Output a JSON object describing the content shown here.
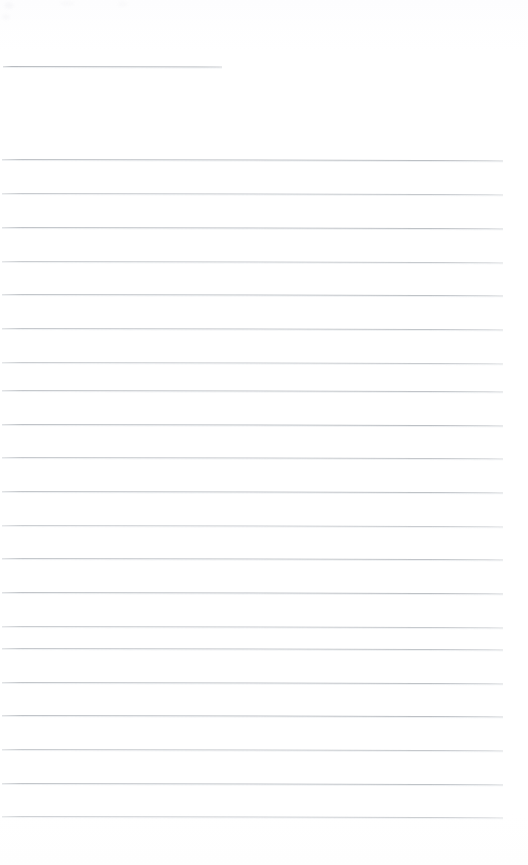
{
  "document": {
    "kind": "scanned-lined-paper",
    "title_line_present": true,
    "page_width": 528,
    "page_height": 865,
    "background_color": "#ffffff",
    "rule_color": "#b9bdc2",
    "rule_thickness_px": 1,
    "text_content": "",
    "visible_text": [],
    "notes": "Blank ruled writing paper, no handwriting or printed text visible."
  },
  "header_rule": {
    "name": "title-rule",
    "x": 3,
    "y": 66,
    "width": 219,
    "tilt_deg": 0.12,
    "opacity": 0.95
  },
  "body_rules": [
    {
      "y": 159,
      "x": 2,
      "width": 501,
      "tilt_deg": 0.14,
      "opacity": 0.95
    },
    {
      "y": 193,
      "x": 2,
      "width": 501,
      "tilt_deg": 0.13,
      "opacity": 0.82
    },
    {
      "y": 227,
      "x": 2,
      "width": 501,
      "tilt_deg": 0.14,
      "opacity": 0.92
    },
    {
      "y": 261,
      "x": 2,
      "width": 501,
      "tilt_deg": 0.13,
      "opacity": 0.8
    },
    {
      "y": 294,
      "x": 2,
      "width": 501,
      "tilt_deg": 0.14,
      "opacity": 0.9
    },
    {
      "y": 328,
      "x": 2,
      "width": 501,
      "tilt_deg": 0.13,
      "opacity": 0.86
    },
    {
      "y": 362,
      "x": 2,
      "width": 501,
      "tilt_deg": 0.14,
      "opacity": 0.78
    },
    {
      "y": 390,
      "x": 2,
      "width": 501,
      "tilt_deg": 0.13,
      "opacity": 0.88
    },
    {
      "y": 424,
      "x": 2,
      "width": 501,
      "tilt_deg": 0.14,
      "opacity": 0.95
    },
    {
      "y": 457,
      "x": 2,
      "width": 501,
      "tilt_deg": 0.13,
      "opacity": 0.84
    },
    {
      "y": 491,
      "x": 2,
      "width": 501,
      "tilt_deg": 0.14,
      "opacity": 0.9
    },
    {
      "y": 525,
      "x": 2,
      "width": 501,
      "tilt_deg": 0.13,
      "opacity": 0.76
    },
    {
      "y": 558,
      "x": 2,
      "width": 501,
      "tilt_deg": 0.14,
      "opacity": 0.88
    },
    {
      "y": 592,
      "x": 2,
      "width": 501,
      "tilt_deg": 0.13,
      "opacity": 0.92
    },
    {
      "y": 626,
      "x": 2,
      "width": 501,
      "tilt_deg": 0.14,
      "opacity": 0.8
    },
    {
      "y": 648,
      "x": 2,
      "width": 501,
      "tilt_deg": 0.13,
      "opacity": 0.86
    },
    {
      "y": 682,
      "x": 2,
      "width": 501,
      "tilt_deg": 0.14,
      "opacity": 0.9
    },
    {
      "y": 715,
      "x": 2,
      "width": 501,
      "tilt_deg": 0.13,
      "opacity": 0.94
    },
    {
      "y": 749,
      "x": 2,
      "width": 501,
      "tilt_deg": 0.14,
      "opacity": 0.82
    },
    {
      "y": 783,
      "x": 2,
      "width": 501,
      "tilt_deg": 0.13,
      "opacity": 0.9
    },
    {
      "y": 816,
      "x": 2,
      "width": 501,
      "tilt_deg": 0.14,
      "opacity": 0.72
    }
  ],
  "scan_artifacts": [
    {
      "x": 4,
      "y": 2,
      "w": 10,
      "h": 7,
      "opacity": 0.6
    },
    {
      "x": 60,
      "y": 1,
      "w": 14,
      "h": 5,
      "opacity": 0.45
    },
    {
      "x": 118,
      "y": 1,
      "w": 9,
      "h": 6,
      "opacity": 0.4
    },
    {
      "x": 2,
      "y": 14,
      "w": 8,
      "h": 6,
      "opacity": 0.5
    }
  ]
}
